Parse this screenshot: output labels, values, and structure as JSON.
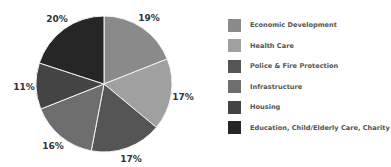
{
  "chart_data": {
    "type": "pie",
    "title": "",
    "categories": [
      "Economic Development",
      "Health Care",
      "Police & Fire Protection",
      "Infrastructure",
      "Housing",
      "Education, Child/Elderly Care, Charity"
    ],
    "values": [
      19,
      17,
      17,
      16,
      11,
      20
    ],
    "labels": [
      "19%",
      "17%",
      "17%",
      "16%",
      "11%",
      "20%"
    ],
    "colors": [
      "#8a8a8a",
      "#a0a0a0",
      "#555555",
      "#6e6e6e",
      "#444444",
      "#262626"
    ],
    "start_angle": "12 o'clock",
    "direction": "clockwise",
    "legend_position": "right"
  },
  "legend": {
    "items": [
      {
        "label": "Economic Development",
        "color": "#8a8a8a"
      },
      {
        "label": "Health Care",
        "color": "#a0a0a0"
      },
      {
        "label": "Police & Fire Protection",
        "color": "#555555"
      },
      {
        "label": "Infrastructure",
        "color": "#6e6e6e"
      },
      {
        "label": "Housing",
        "color": "#444444"
      },
      {
        "label": "Education, Child/Elderly Care, Charity",
        "color": "#262626"
      }
    ]
  }
}
